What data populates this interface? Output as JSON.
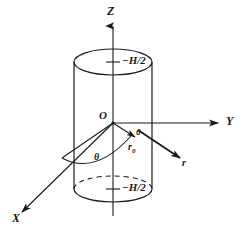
{
  "figure": {
    "type": "technical-line-diagram",
    "background_color": "#ffffff",
    "ink_color": "#1a1a1a"
  },
  "axes": {
    "z": {
      "label": "Z",
      "direction": "up",
      "arrow": true
    },
    "y": {
      "label": "Y",
      "direction": "right",
      "arrow": true
    },
    "x": {
      "label": "X",
      "direction": "down-left",
      "arrow": true
    }
  },
  "cylinder": {
    "top_cap_label": "−H/2",
    "bottom_cap_label": "−H/2",
    "top_cap_dashed_back": false,
    "bottom_cap_dashed_back": true
  },
  "origin": {
    "label": "O"
  },
  "vectors": {
    "r0": {
      "label": "r",
      "subscript": "0",
      "display": "r₀"
    },
    "r": {
      "label": "r"
    }
  },
  "angle": {
    "label": "θ"
  },
  "marks": {
    "tick_prefix": "–",
    "arrow_tip_mark": "6"
  }
}
